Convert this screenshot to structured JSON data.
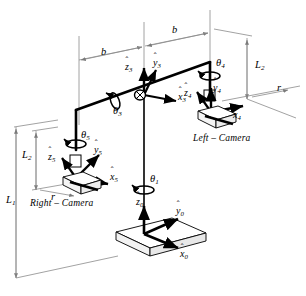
{
  "figure": {
    "type": "kinematic-diagram",
    "background": "#ffffff",
    "line_color": "#000000",
    "thin_line_color": "#808080"
  },
  "labels": {
    "baseline_left": "b",
    "baseline_right": "b",
    "length_L1": "L",
    "length_L1_sub": "1",
    "length_L2_left": "L",
    "length_L2_left_sub": "2",
    "length_L2_right": "L",
    "length_L2_right_sub": "2",
    "radius_left": "r",
    "radius_right": "r"
  },
  "joints": [
    {
      "name": "theta1",
      "symbol": "θ",
      "sub": "1"
    },
    {
      "name": "theta3",
      "symbol": "θ",
      "sub": "3"
    },
    {
      "name": "theta4",
      "symbol": "θ",
      "sub": "4"
    },
    {
      "name": "theta5",
      "symbol": "θ",
      "sub": "5"
    }
  ],
  "frames": [
    {
      "id": "frame0",
      "label": "base-frame",
      "axes": [
        {
          "axis": "z",
          "symbol": "z",
          "sub": "0",
          "hat": "ˆ"
        },
        {
          "axis": "y",
          "symbol": "y",
          "sub": "0",
          "hat": "ˆ"
        },
        {
          "axis": "x",
          "symbol": "x",
          "sub": "0",
          "hat": "ˆ"
        }
      ]
    },
    {
      "id": "frame3",
      "label": "beam-center-frame",
      "axes": [
        {
          "axis": "z",
          "symbol": "z",
          "sub": "3",
          "hat": "ˆ"
        },
        {
          "axis": "y",
          "symbol": "y",
          "sub": "3",
          "hat": "ˆ"
        },
        {
          "axis": "x",
          "symbol": "x",
          "sub": "3",
          "hat": "ˆ"
        }
      ]
    },
    {
      "id": "frame4",
      "label": "left-camera-frame",
      "axes": [
        {
          "axis": "z",
          "symbol": "z",
          "sub": "4",
          "hat": "ˆ"
        },
        {
          "axis": "y",
          "symbol": "y",
          "sub": "4",
          "hat": "ˆ"
        },
        {
          "axis": "x",
          "symbol": "x",
          "sub": "4",
          "hat": "ˆ"
        }
      ]
    },
    {
      "id": "frame5",
      "label": "right-camera-frame",
      "axes": [
        {
          "axis": "z",
          "symbol": "z",
          "sub": "5",
          "hat": "ˆ"
        },
        {
          "axis": "y",
          "symbol": "y",
          "sub": "5",
          "hat": "ˆ"
        },
        {
          "axis": "x",
          "symbol": "x",
          "sub": "5",
          "hat": "ˆ"
        }
      ]
    }
  ],
  "cameras": {
    "left": "Left – Camera",
    "right": "Right – Camera"
  }
}
